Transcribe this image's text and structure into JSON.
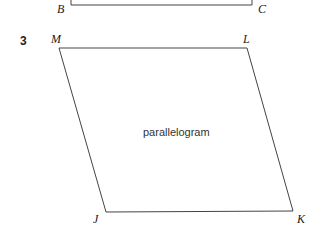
{
  "figure_top": {
    "vertices": [
      {
        "label": "B"
      },
      {
        "label": "C"
      }
    ]
  },
  "question": {
    "number": "3",
    "shape_name": "parallelogram",
    "vertices": [
      {
        "label": "M"
      },
      {
        "label": "L"
      },
      {
        "label": "J"
      },
      {
        "label": "K"
      }
    ]
  }
}
